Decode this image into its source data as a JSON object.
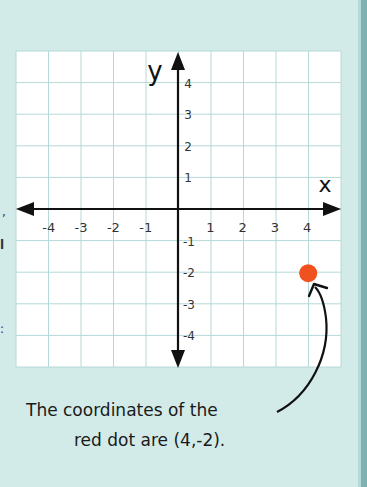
{
  "diagram": {
    "title": "",
    "axes": {
      "x_label": "x",
      "y_label": "y",
      "x_ticks": [
        "-4",
        "-3",
        "-2",
        "-1",
        "1",
        "2",
        "3",
        "4"
      ],
      "y_ticks_positive": [
        "1",
        "2",
        "3",
        "4"
      ],
      "y_ticks_negative": [
        "-1",
        "-2",
        "-3",
        "-4"
      ]
    },
    "point": {
      "label": "red dot",
      "x": 4,
      "y": -2,
      "color": "#f0521f"
    },
    "caption": {
      "line1": "The coordinates of the",
      "line2": "red dot are (4,-2)."
    }
  },
  "chart_data": {
    "type": "scatter",
    "title": "",
    "xlabel": "x",
    "ylabel": "y",
    "xlim": [
      -5,
      5
    ],
    "ylim": [
      -5,
      5
    ],
    "grid": true,
    "x_tick_labels": [
      "-4",
      "-3",
      "-2",
      "-1",
      "1",
      "2",
      "3",
      "4"
    ],
    "y_tick_labels": [
      "-4",
      "-3",
      "-2",
      "-1",
      "1",
      "2",
      "3",
      "4"
    ],
    "series": [
      {
        "name": "red dot",
        "points": [
          {
            "x": 4,
            "y": -2
          }
        ],
        "color": "#f0521f"
      }
    ],
    "annotations": [
      "The coordinates of the red dot are (4,-2)."
    ]
  },
  "colors": {
    "background": "#d3ebe8",
    "grid_paper": "#ffffff",
    "grid_line": "#b5d8d8",
    "axis": "#111111",
    "dot": "#f0521f"
  }
}
